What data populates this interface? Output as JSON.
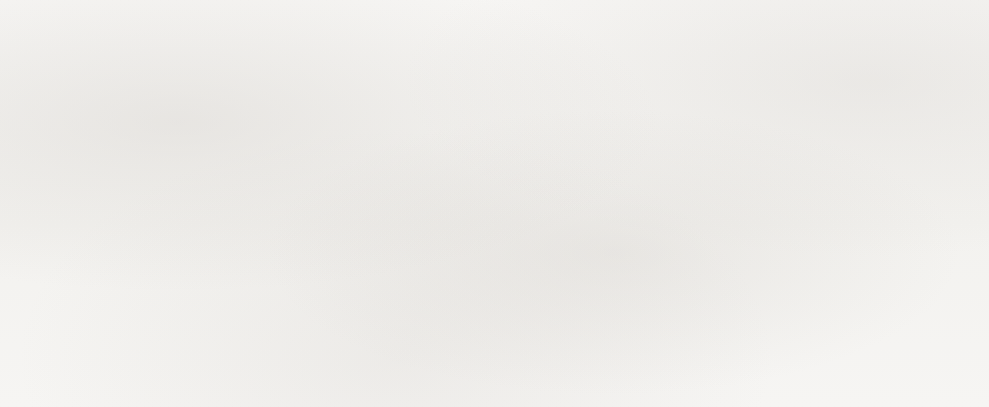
{
  "chart_data": {
    "type": "line",
    "title": "",
    "subtitle": "",
    "xlabel": "",
    "ylabel": "",
    "categories": [
      "1990",
      "1991",
      "1992",
      "1993",
      "1994",
      "1995",
      "1996"
    ],
    "x": [
      1990,
      1991,
      1992,
      1993,
      1994,
      1995,
      1996
    ],
    "values": [
      10.0,
      27.8,
      25.4,
      29.7,
      34.7,
      59.2,
      53.2
    ],
    "series": [
      {
        "name": "",
        "values": [
          10.0,
          27.8,
          25.4,
          29.7,
          34.7,
          59.2,
          53.2
        ]
      }
    ],
    "ylim": [
      10,
      60
    ],
    "xlim": [
      1990,
      1996
    ],
    "ytick_values": [
      60,
      55,
      50,
      45,
      40,
      35,
      30,
      25,
      20,
      15,
      10
    ],
    "ytick_labels": [
      "$60.00",
      "55.00",
      "50.00",
      "45.00",
      "40.00",
      "35.00",
      "30.00",
      "25.00",
      "20.00",
      "15.00",
      "10.00"
    ],
    "xtick_labels": [
      "1990",
      "1991",
      "1992",
      "1993",
      "1994",
      "1995",
      "1996"
    ],
    "grid": "horizontal",
    "legend": "none",
    "marker": "filled-circle",
    "line_color": "#151311",
    "grid_color": "#2b2927",
    "background_color": "#f5f4f2",
    "text_color": "#121110",
    "annotations": []
  },
  "figure": {
    "rule_top_name": "top-divider-rule",
    "rule_bottom_name": "bottom-divider-rule"
  }
}
